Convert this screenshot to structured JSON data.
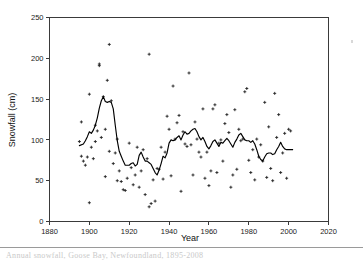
{
  "figure": {
    "caption_rule_top_y": 247,
    "caption_text": "Annual snowfall, Goose Bay, Newfoundland, 1895-2008"
  },
  "chart_data": {
    "type": "scatter",
    "title": "",
    "xlabel": "Year",
    "ylabel": "Snowfall (cm)",
    "xlim": [
      1880,
      2020
    ],
    "ylim": [
      0,
      250
    ],
    "xticks": [
      1880,
      1900,
      1920,
      1940,
      1960,
      1980,
      2000,
      2020
    ],
    "yticks": [
      0,
      50,
      100,
      150,
      200,
      250
    ],
    "grid": false,
    "legend": null,
    "series": [
      {
        "name": "Annual snowfall",
        "type": "scatter",
        "marker": "plus",
        "points": [
          [
            1895,
            98
          ],
          [
            1896,
            122
          ],
          [
            1896,
            80
          ],
          [
            1897,
            74
          ],
          [
            1898,
            69
          ],
          [
            1899,
            79
          ],
          [
            1900,
            156
          ],
          [
            1900,
            23
          ],
          [
            1901,
            91
          ],
          [
            1902,
            77
          ],
          [
            1903,
            118
          ],
          [
            1903,
            98
          ],
          [
            1904,
            111
          ],
          [
            1905,
            193
          ],
          [
            1905,
            191
          ],
          [
            1906,
            103
          ],
          [
            1907,
            153
          ],
          [
            1908,
            113
          ],
          [
            1908,
            55
          ],
          [
            1909,
            173
          ],
          [
            1910,
            217
          ],
          [
            1910,
            86
          ],
          [
            1911,
            148
          ],
          [
            1912,
            71
          ],
          [
            1913,
            84
          ],
          [
            1914,
            101
          ],
          [
            1914,
            50
          ],
          [
            1915,
            62
          ],
          [
            1916,
            49
          ],
          [
            1917,
            39
          ],
          [
            1918,
            38
          ],
          [
            1919,
            53
          ],
          [
            1920,
            96
          ],
          [
            1921,
            66
          ],
          [
            1922,
            45
          ],
          [
            1923,
            57
          ],
          [
            1924,
            91
          ],
          [
            1925,
            42
          ],
          [
            1926,
            62
          ],
          [
            1927,
            88
          ],
          [
            1928,
            33
          ],
          [
            1929,
            77
          ],
          [
            1930,
            205
          ],
          [
            1930,
            18
          ],
          [
            1931,
            22
          ],
          [
            1932,
            51
          ],
          [
            1933,
            25
          ],
          [
            1934,
            65
          ],
          [
            1935,
            64
          ],
          [
            1936,
            91
          ],
          [
            1937,
            52
          ],
          [
            1938,
            85
          ],
          [
            1939,
            129
          ],
          [
            1940,
            113
          ],
          [
            1941,
            56
          ],
          [
            1942,
            166
          ],
          [
            1943,
            101
          ],
          [
            1944,
            121
          ],
          [
            1945,
            130
          ],
          [
            1946,
            37
          ],
          [
            1947,
            110
          ],
          [
            1948,
            95
          ],
          [
            1949,
            92
          ],
          [
            1950,
            182
          ],
          [
            1951,
            94
          ],
          [
            1952,
            57
          ],
          [
            1953,
            122
          ],
          [
            1954,
            101
          ],
          [
            1955,
            85
          ],
          [
            1956,
            79
          ],
          [
            1957,
            138
          ],
          [
            1958,
            53
          ],
          [
            1959,
            85
          ],
          [
            1960,
            44
          ],
          [
            1961,
            62
          ],
          [
            1962,
            138
          ],
          [
            1963,
            143
          ],
          [
            1964,
            60
          ],
          [
            1965,
            96
          ],
          [
            1966,
            100
          ],
          [
            1967,
            74
          ],
          [
            1968,
            120
          ],
          [
            1969,
            131
          ],
          [
            1970,
            109
          ],
          [
            1971,
            42
          ],
          [
            1972,
            57
          ],
          [
            1973,
            137
          ],
          [
            1974,
            64
          ],
          [
            1975,
            113
          ],
          [
            1976,
            99
          ],
          [
            1977,
            101
          ],
          [
            1978,
            159
          ],
          [
            1979,
            163
          ],
          [
            1980,
            75
          ],
          [
            1981,
            60
          ],
          [
            1982,
            88
          ],
          [
            1983,
            51
          ],
          [
            1984,
            101
          ],
          [
            1985,
            79
          ],
          [
            1986,
            94
          ],
          [
            1987,
            74
          ],
          [
            1988,
            146
          ],
          [
            1989,
            54
          ],
          [
            1990,
            116
          ],
          [
            1991,
            65
          ],
          [
            1992,
            50
          ],
          [
            1993,
            157
          ],
          [
            1994,
            103
          ],
          [
            1995,
            131
          ],
          [
            1996,
            60
          ],
          [
            1997,
            84
          ],
          [
            1998,
            108
          ],
          [
            1999,
            53
          ],
          [
            2000,
            113
          ],
          [
            2001,
            111
          ]
        ]
      },
      {
        "name": "Running mean",
        "type": "line",
        "points": [
          [
            1895,
            93
          ],
          [
            1897,
            95
          ],
          [
            1898,
            99
          ],
          [
            1899,
            104
          ],
          [
            1900,
            110
          ],
          [
            1901,
            108
          ],
          [
            1902,
            112
          ],
          [
            1903,
            118
          ],
          [
            1904,
            127
          ],
          [
            1905,
            139
          ],
          [
            1906,
            148
          ],
          [
            1907,
            153
          ],
          [
            1908,
            147
          ],
          [
            1909,
            146
          ],
          [
            1910,
            147
          ],
          [
            1911,
            146
          ],
          [
            1912,
            138
          ],
          [
            1913,
            118
          ],
          [
            1914,
            99
          ],
          [
            1915,
            86
          ],
          [
            1916,
            80
          ],
          [
            1917,
            74
          ],
          [
            1918,
            69
          ],
          [
            1919,
            69
          ],
          [
            1920,
            69
          ],
          [
            1921,
            71
          ],
          [
            1922,
            72
          ],
          [
            1923,
            68
          ],
          [
            1924,
            70
          ],
          [
            1925,
            81
          ],
          [
            1926,
            85
          ],
          [
            1927,
            79
          ],
          [
            1928,
            74
          ],
          [
            1929,
            74
          ],
          [
            1930,
            72
          ],
          [
            1931,
            70
          ],
          [
            1932,
            65
          ],
          [
            1933,
            60
          ],
          [
            1934,
            57
          ],
          [
            1935,
            63
          ],
          [
            1936,
            71
          ],
          [
            1937,
            80
          ],
          [
            1938,
            78
          ],
          [
            1939,
            84
          ],
          [
            1940,
            96
          ],
          [
            1941,
            100
          ],
          [
            1942,
            99
          ],
          [
            1943,
            100
          ],
          [
            1944,
            103
          ],
          [
            1945,
            105
          ],
          [
            1946,
            100
          ],
          [
            1947,
            106
          ],
          [
            1948,
            110
          ],
          [
            1949,
            107
          ],
          [
            1950,
            108
          ],
          [
            1951,
            111
          ],
          [
            1952,
            113
          ],
          [
            1953,
            114
          ],
          [
            1954,
            110
          ],
          [
            1955,
            104
          ],
          [
            1956,
            100
          ],
          [
            1957,
            103
          ],
          [
            1958,
            98
          ],
          [
            1959,
            92
          ],
          [
            1960,
            89
          ],
          [
            1961,
            93
          ],
          [
            1962,
            98
          ],
          [
            1963,
            100
          ],
          [
            1964,
            96
          ],
          [
            1965,
            92
          ],
          [
            1966,
            97
          ],
          [
            1967,
            96
          ],
          [
            1968,
            99
          ],
          [
            1969,
            102
          ],
          [
            1970,
            99
          ],
          [
            1971,
            95
          ],
          [
            1972,
            91
          ],
          [
            1973,
            97
          ],
          [
            1974,
            101
          ],
          [
            1975,
            106
          ],
          [
            1976,
            108
          ],
          [
            1977,
            104
          ],
          [
            1978,
            100
          ],
          [
            1979,
            99
          ],
          [
            1980,
            99
          ],
          [
            1981,
            97
          ],
          [
            1982,
            99
          ],
          [
            1983,
            95
          ],
          [
            1984,
            88
          ],
          [
            1985,
            80
          ],
          [
            1986,
            76
          ],
          [
            1987,
            74
          ],
          [
            1988,
            79
          ],
          [
            1989,
            83
          ],
          [
            1990,
            84
          ],
          [
            1991,
            84
          ],
          [
            1992,
            82
          ],
          [
            1993,
            83
          ],
          [
            1994,
            88
          ],
          [
            1995,
            92
          ],
          [
            1996,
            97
          ],
          [
            1997,
            92
          ],
          [
            1998,
            89
          ],
          [
            1999,
            88
          ],
          [
            2000,
            88
          ],
          [
            2002,
            88
          ]
        ]
      }
    ]
  }
}
